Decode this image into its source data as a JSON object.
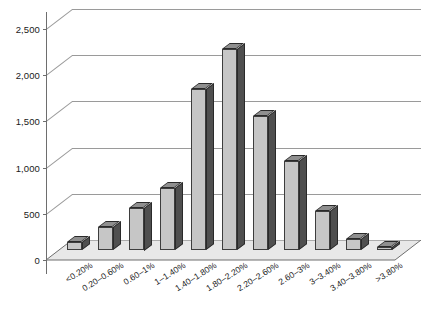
{
  "chart_data": {
    "type": "bar",
    "title": "",
    "subtitle": "",
    "xlabel": "",
    "ylabel": "",
    "categories": [
      "<0.20%",
      "0.20–0.60%",
      "0.60–1%",
      "1–1.40%",
      "1.40–1.80%",
      "1.80–2.20%",
      "2.20–2.60%",
      "2.60–3%",
      "3–3.40%",
      "3.40–3.80%",
      ">3.80%"
    ],
    "values": [
      90,
      250,
      460,
      670,
      1740,
      2180,
      1450,
      960,
      420,
      120,
      30
    ],
    "ylim": [
      0,
      2500
    ],
    "ytick_values": [
      0,
      500,
      1000,
      1500,
      2000,
      2500
    ],
    "ytick_labels": [
      "0",
      "500",
      "1,000",
      "1,500",
      "2,000",
      "2,500"
    ],
    "grid": true,
    "legend": false,
    "style": "3d-column",
    "colors": {
      "bar_front": "#c6c6c6",
      "bar_side": "#4f4f4f",
      "bar_top": "#8f8f8f",
      "bar_outline": "#3d3d3d",
      "gridline": "#8c8c8c",
      "axis": "#6e6e6e",
      "floor": "#e8e8e8",
      "text": "#1a1a1a",
      "background": "#ffffff"
    }
  }
}
